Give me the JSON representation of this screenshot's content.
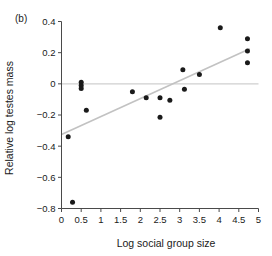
{
  "figure": {
    "panel_label": "(b)",
    "colors": {
      "point": "#1a1a1a",
      "axis": "#4a4a4a",
      "zero_line": "#cfcfcf",
      "fit_line": "#c2c2c2",
      "background": "#ffffff"
    }
  },
  "chart_data": {
    "type": "scatter",
    "title": "",
    "panel": "(b)",
    "xlabel": "Log social group size",
    "ylabel": "Relative log testes mass",
    "xlim": [
      0,
      5
    ],
    "ylim": [
      -0.8,
      0.4
    ],
    "xticks": [
      0,
      0.5,
      1,
      1.5,
      2,
      2.5,
      3,
      3.5,
      4,
      4.5,
      5
    ],
    "xticklabels": [
      "0",
      "0.5",
      "1",
      "1.5",
      "2",
      "2.5",
      "3",
      "3.5",
      "4",
      "4.5",
      "5"
    ],
    "yticks": [
      -0.8,
      -0.6,
      -0.4,
      -0.2,
      0,
      0.2,
      0.4
    ],
    "yticklabels": [
      "−0.8",
      "−0.6",
      "−0.4",
      "−0.2",
      "0",
      "0.2",
      "0.4"
    ],
    "grid": false,
    "legend": false,
    "points": [
      {
        "x": 0.17,
        "y": -0.34
      },
      {
        "x": 0.28,
        "y": -0.76
      },
      {
        "x": 0.5,
        "y": 0.01
      },
      {
        "x": 0.5,
        "y": -0.01
      },
      {
        "x": 0.5,
        "y": -0.03
      },
      {
        "x": 0.63,
        "y": -0.17
      },
      {
        "x": 1.8,
        "y": -0.05
      },
      {
        "x": 2.15,
        "y": -0.09
      },
      {
        "x": 2.5,
        "y": -0.09
      },
      {
        "x": 2.5,
        "y": -0.215
      },
      {
        "x": 2.75,
        "y": -0.105
      },
      {
        "x": 3.08,
        "y": 0.09
      },
      {
        "x": 3.12,
        "y": -0.035
      },
      {
        "x": 3.5,
        "y": 0.06
      },
      {
        "x": 4.03,
        "y": 0.36
      },
      {
        "x": 4.72,
        "y": 0.29
      },
      {
        "x": 4.72,
        "y": 0.21
      },
      {
        "x": 4.72,
        "y": 0.135
      }
    ],
    "zero_reference_line": {
      "y": 0,
      "x_from": 0,
      "x_to": 5
    },
    "fit_line": {
      "x_from": 0.0,
      "y_from": -0.325,
      "x_to": 4.78,
      "y_to": 0.225
    }
  }
}
